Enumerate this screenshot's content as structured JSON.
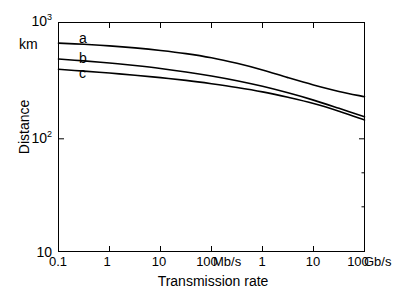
{
  "chart_data": {
    "type": "line",
    "title": "",
    "xlabel": "Transmission rate",
    "ylabel": "Distance",
    "yunit": "km",
    "xscale": "log",
    "yscale": "log",
    "grid": false,
    "legend_position": "inline-curve-labels",
    "xlim": [
      0.1,
      100
    ],
    "ylim": [
      10,
      1000
    ],
    "x_tick_labels": [
      "0.1",
      "1",
      "10",
      "100",
      "1",
      "10",
      "100"
    ],
    "x_tick_unit_annotations": [
      {
        "after_tick": "100",
        "text": "Mb/s"
      },
      {
        "after_tick": "100",
        "text": "Gb/s"
      }
    ],
    "y_tick_labels": [
      "10",
      "10²",
      "10³"
    ],
    "y_tick_values": [
      10,
      100,
      1000
    ],
    "x_values_mbps": [
      0.1,
      0.316,
      1,
      3.16,
      10,
      31.6,
      100,
      316,
      1000,
      3160,
      10000,
      31600,
      100000
    ],
    "series": [
      {
        "name": "a",
        "label": "a",
        "color": "#000000",
        "values": [
          660,
          645,
          625,
          600,
          570,
          535,
          492,
          440,
          385,
          330,
          285,
          250,
          225
        ]
      },
      {
        "name": "b",
        "label": "b",
        "color": "#000000",
        "values": [
          480,
          462,
          443,
          421,
          397,
          370,
          341,
          310,
          277,
          243,
          210,
          178,
          150
        ]
      },
      {
        "name": "c",
        "label": "c",
        "color": "#000000",
        "values": [
          390,
          376,
          362,
          346,
          330,
          312,
          292,
          271,
          248,
          222,
          196,
          168,
          141
        ]
      }
    ],
    "colors": {
      "axis": "#000000",
      "curve": "#000000",
      "background": "#ffffff"
    }
  },
  "axes": {
    "x_title": "Transmission rate",
    "y_title": "Distance",
    "y_unit": "km",
    "y_ticks": [
      {
        "id": "ytick-10",
        "base": "10",
        "exp": ""
      },
      {
        "id": "ytick-100",
        "base": "10",
        "exp": "2"
      },
      {
        "id": "ytick-1000",
        "base": "10",
        "exp": "3"
      }
    ],
    "x_ticks": [
      "0.1",
      "1",
      "10",
      "100",
      "1",
      "10",
      "100"
    ],
    "x_unit_mbs": "Mb/s",
    "x_unit_gbs": "Gb/s"
  },
  "curve_labels": {
    "a": "a",
    "b": "b",
    "c": "c"
  }
}
